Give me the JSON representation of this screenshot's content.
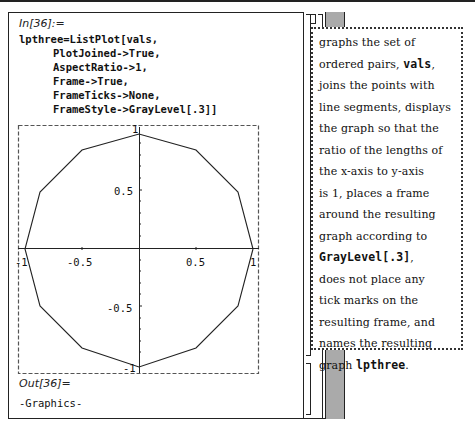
{
  "notebook": {
    "input_label": "In[36]:=",
    "code_lines": [
      "lpthree=ListPlot[vals,",
      "PlotJoined->True,",
      "AspectRatio->1,",
      "Frame->True,",
      "FrameTicks->None,",
      "FrameStyle->GrayLevel[.3]]"
    ],
    "output_label": "Out[36]=",
    "output_value": "-Graphics-"
  },
  "callout": {
    "lines": [
      {
        "parts": [
          {
            "t": "graphs the set of"
          }
        ]
      },
      {
        "parts": [
          {
            "t": "ordered pairs, "
          },
          {
            "t": "vals",
            "mono": true
          },
          {
            "t": ","
          }
        ]
      },
      {
        "parts": [
          {
            "t": "joins the points with"
          }
        ]
      },
      {
        "parts": [
          {
            "t": "line segments, displays"
          }
        ]
      },
      {
        "parts": [
          {
            "t": "the graph so that the"
          }
        ]
      },
      {
        "parts": [
          {
            "t": "ratio of the lengths of"
          }
        ]
      },
      {
        "parts": [
          {
            "t": "the x-axis to y-axis"
          }
        ]
      },
      {
        "parts": [
          {
            "t": "is 1, places a frame"
          }
        ]
      },
      {
        "parts": [
          {
            "t": "around the resulting"
          }
        ]
      },
      {
        "parts": [
          {
            "t": "graph according to"
          }
        ]
      },
      {
        "parts": [
          {
            "t": "GrayLevel[.3]",
            "mono": true
          },
          {
            "t": ","
          }
        ]
      },
      {
        "parts": [
          {
            "t": "does not place any"
          }
        ]
      },
      {
        "parts": [
          {
            "t": "tick marks on the"
          }
        ]
      },
      {
        "parts": [
          {
            "t": "resulting frame, and"
          }
        ]
      },
      {
        "parts": [
          {
            "t": "names the resulting"
          }
        ]
      },
      {
        "parts": [
          {
            "t": "graph "
          },
          {
            "t": "lpthree",
            "mono": true
          },
          {
            "t": "."
          }
        ]
      }
    ]
  },
  "chart_data": {
    "type": "line",
    "title": "",
    "xlabel": "",
    "ylabel": "",
    "xlim": [
      -1,
      1
    ],
    "ylim": [
      -1,
      1
    ],
    "grid": false,
    "frame": true,
    "frame_style": "dashed gray",
    "axis_tick_labels": {
      "x": [
        "-1",
        "-0.5",
        "0.5",
        "1"
      ],
      "y": [
        "-1",
        "-0.5",
        "0.5",
        "1"
      ]
    },
    "series": [
      {
        "name": "lpthree",
        "points": [
          [
            1,
            0
          ],
          [
            0.866,
            0.5
          ],
          [
            0.5,
            0.866
          ],
          [
            0,
            1
          ],
          [
            -0.5,
            0.866
          ],
          [
            -0.866,
            0.5
          ],
          [
            -1,
            0
          ],
          [
            -0.866,
            -0.5
          ],
          [
            -0.5,
            -0.866
          ],
          [
            0,
            -1
          ],
          [
            0.5,
            -0.866
          ],
          [
            0.866,
            -0.5
          ],
          [
            1,
            0
          ]
        ]
      }
    ]
  }
}
